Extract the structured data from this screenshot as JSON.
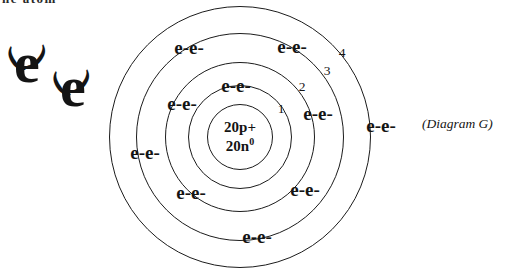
{
  "canvas": {
    "background": "#ffffff",
    "ink": "#1c1c1c"
  },
  "top_clipped_text": "he atom",
  "side_label": "(Diagram G)",
  "free_electrons": {
    "glyph": "e",
    "arc_left": "(",
    "arc_right": ")"
  },
  "atom": {
    "element_implied": "calcium",
    "nucleus": {
      "protons": "20p+",
      "neutrons_base": "20n",
      "neutrons_sup": "0"
    },
    "electron_pair_label": "e-e-",
    "shell_numbers": [
      "1",
      "2",
      "3",
      "4"
    ],
    "electron_pairs_per_shell": {
      "shell1": 1,
      "shell2": 4,
      "shell3": 4,
      "shell4": 1
    }
  }
}
